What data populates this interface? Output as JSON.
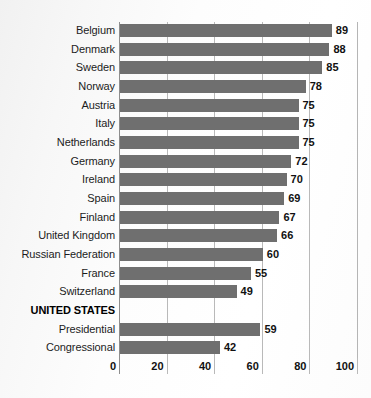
{
  "chart_data": {
    "type": "bar",
    "orientation": "horizontal",
    "title": "",
    "subtitle": "",
    "xlabel": "",
    "ylabel": "",
    "xlim": [
      0,
      100
    ],
    "xticks": [
      0,
      20,
      40,
      60,
      80,
      100
    ],
    "xtick_labels": [
      "0",
      "20",
      "40",
      "60",
      "80",
      "100"
    ],
    "grid": true,
    "legend": false,
    "bar_color": "#6f6f6f",
    "gridline_color": "#b9b9b9",
    "axis_color": "#8e8e8e",
    "text_color": "#1c1c1c",
    "background_color": "#ffffff",
    "categories": [
      "Belgium",
      "Denmark",
      "Sweden",
      "Norway",
      "Austria",
      "Italy",
      "Netherlands",
      "Germany",
      "Ireland",
      "Spain",
      "Finland",
      "United Kingdom",
      "Russian Federation",
      "France",
      "Switzerland",
      "UNITED STATES",
      "Presidential",
      "Congressional"
    ],
    "values": [
      89,
      88,
      85,
      78,
      75,
      75,
      75,
      72,
      70,
      69,
      67,
      66,
      60,
      55,
      49,
      null,
      59,
      42
    ],
    "rows": [
      {
        "label": "Belgium",
        "value": 89,
        "value_text": "89",
        "is_group_header": false
      },
      {
        "label": "Denmark",
        "value": 88,
        "value_text": "88",
        "is_group_header": false
      },
      {
        "label": "Sweden",
        "value": 85,
        "value_text": "85",
        "is_group_header": false
      },
      {
        "label": "Norway",
        "value": 78,
        "value_text": "78",
        "is_group_header": false
      },
      {
        "label": "Austria",
        "value": 75,
        "value_text": "75",
        "is_group_header": false
      },
      {
        "label": "Italy",
        "value": 75,
        "value_text": "75",
        "is_group_header": false
      },
      {
        "label": "Netherlands",
        "value": 75,
        "value_text": "75",
        "is_group_header": false
      },
      {
        "label": "Germany",
        "value": 72,
        "value_text": "72",
        "is_group_header": false
      },
      {
        "label": "Ireland",
        "value": 70,
        "value_text": "70",
        "is_group_header": false
      },
      {
        "label": "Spain",
        "value": 69,
        "value_text": "69",
        "is_group_header": false
      },
      {
        "label": "Finland",
        "value": 67,
        "value_text": "67",
        "is_group_header": false
      },
      {
        "label": "United Kingdom",
        "value": 66,
        "value_text": "66",
        "is_group_header": false
      },
      {
        "label": "Russian Federation",
        "value": 60,
        "value_text": "60",
        "is_group_header": false
      },
      {
        "label": "France",
        "value": 55,
        "value_text": "55",
        "is_group_header": false
      },
      {
        "label": "Switzerland",
        "value": 49,
        "value_text": "49",
        "is_group_header": false
      },
      {
        "label": "UNITED STATES",
        "value": null,
        "value_text": "",
        "is_group_header": true
      },
      {
        "label": "Presidential",
        "value": 59,
        "value_text": "59",
        "is_group_header": false
      },
      {
        "label": "Congressional",
        "value": 42,
        "value_text": "42",
        "is_group_header": false
      }
    ]
  }
}
